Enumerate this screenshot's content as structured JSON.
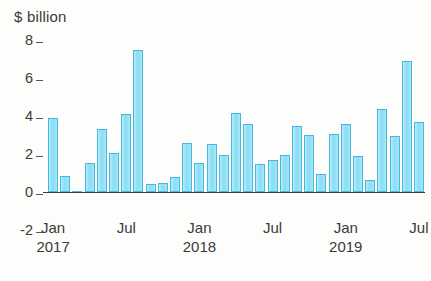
{
  "chart_data": {
    "type": "bar",
    "title": "$ billion",
    "xlabel": "",
    "ylabel": "$ billion",
    "ylim": [
      -2,
      8
    ],
    "yticks": [
      "8",
      "6",
      "4",
      "2",
      "0",
      "-2"
    ],
    "ytick_values": [
      8,
      6,
      4,
      2,
      0,
      -2
    ],
    "grid": false,
    "legend": null,
    "xtick_labels": [
      {
        "month": "Jan",
        "year": "2017"
      },
      {
        "month": "Jul",
        "year": ""
      },
      {
        "month": "Jan",
        "year": "2018"
      },
      {
        "month": "Jul",
        "year": ""
      },
      {
        "month": "Jan",
        "year": "2019"
      },
      {
        "month": "Jul",
        "year": ""
      }
    ],
    "xtick_indices": [
      0,
      6,
      12,
      18,
      24,
      30
    ],
    "bar_color": "#8ddff5",
    "bar_edge_color": "#46b8dd",
    "axis_color": "#3c3c3c",
    "categories": [
      "Jan 2017",
      "Feb 2017",
      "Mar 2017",
      "Apr 2017",
      "May 2017",
      "Jun 2017",
      "Jul 2017",
      "Aug 2017",
      "Sep 2017",
      "Oct 2017",
      "Nov 2017",
      "Dec 2017",
      "Jan 2018",
      "Feb 2018",
      "Mar 2018",
      "Apr 2018",
      "May 2018",
      "Jun 2018",
      "Jul 2018",
      "Aug 2018",
      "Sep 2018",
      "Oct 2018",
      "Nov 2018",
      "Dec 2018",
      "Jan 2019",
      "Feb 2019",
      "Mar 2019",
      "Apr 2019",
      "May 2019",
      "Jun 2019",
      "Jul 2019"
    ],
    "values": [
      3.9,
      0.85,
      0.03,
      1.55,
      3.3,
      2.05,
      4.1,
      7.45,
      0.4,
      0.45,
      0.8,
      2.6,
      1.55,
      2.55,
      1.95,
      4.15,
      3.6,
      1.5,
      1.7,
      1.95,
      3.5,
      3.0,
      0.95,
      3.05,
      3.6,
      1.9,
      0.65,
      4.35,
      2.95,
      6.9,
      3.7
    ]
  }
}
